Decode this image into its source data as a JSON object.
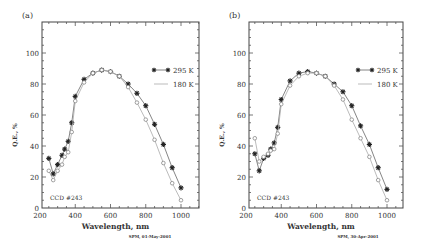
{
  "figure": {
    "footer_a": "SPM, 01-May-2001",
    "footer_b": "SPM, 30-Apr-2001"
  },
  "chart_data": [
    {
      "type": "line",
      "panel_label": "(a)",
      "title": "",
      "xlabel": "Wavelength, nm",
      "ylabel": "Q.E., %",
      "xlim": [
        200,
        1100
      ],
      "ylim": [
        0,
        120
      ],
      "xticks": [
        200,
        400,
        600,
        800,
        1000
      ],
      "yticks": [
        0,
        20,
        40,
        60,
        80,
        100
      ],
      "grid": false,
      "legend_position": "upper right",
      "annotation": "CCD #243",
      "footer": "SPM, 01-May-2001",
      "x": [
        250,
        275,
        300,
        325,
        340,
        360,
        380,
        400,
        450,
        500,
        550,
        600,
        650,
        700,
        750,
        800,
        850,
        900,
        950,
        1000
      ],
      "series": [
        {
          "name": "295 K",
          "marker": "star",
          "values": [
            32,
            22,
            28,
            34,
            38,
            43,
            55,
            72,
            83,
            87,
            89,
            88,
            85,
            80,
            74,
            66,
            54,
            41,
            26,
            13
          ]
        },
        {
          "name": "180 K",
          "marker": "open-circle",
          "values": [
            24,
            18,
            24,
            28,
            33,
            36,
            49,
            69,
            81,
            87,
            89,
            88,
            85,
            78,
            68,
            57,
            44,
            29,
            16,
            5
          ]
        }
      ]
    },
    {
      "type": "line",
      "panel_label": "(b)",
      "title": "",
      "xlabel": "Wavelength, nm",
      "ylabel": "Q.E., %",
      "xlim": [
        200,
        1100
      ],
      "ylim": [
        0,
        120
      ],
      "xticks": [
        200,
        400,
        600,
        800,
        1000
      ],
      "yticks": [
        0,
        20,
        40,
        60,
        80,
        100
      ],
      "grid": false,
      "legend_position": "upper right",
      "annotation": "CCD #243",
      "footer": "SPM, 30-Apr-2001",
      "x": [
        250,
        275,
        300,
        325,
        340,
        360,
        380,
        400,
        450,
        500,
        550,
        600,
        650,
        700,
        750,
        800,
        850,
        900,
        950,
        1000
      ],
      "series": [
        {
          "name": "295 K",
          "marker": "star",
          "values": [
            35,
            24,
            32,
            34,
            38,
            42,
            52,
            70,
            82,
            87,
            88,
            87,
            85,
            80,
            75,
            66,
            53,
            41,
            26,
            12
          ]
        },
        {
          "name": "180 K",
          "marker": "open-circle",
          "values": [
            45,
            30,
            33,
            35,
            37,
            38,
            48,
            67,
            79,
            85,
            87,
            87,
            85,
            79,
            70,
            57,
            45,
            33,
            18,
            5
          ]
        }
      ]
    }
  ]
}
